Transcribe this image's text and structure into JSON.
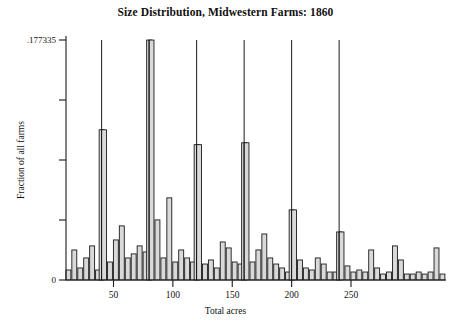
{
  "chart_data": {
    "type": "bar",
    "title": "Size Distribution, Midwestern Farms: 1860",
    "xlabel": "Total acres",
    "ylabel": "Fraction of all farms",
    "xlim": [
      10,
      330
    ],
    "ylim": [
      0,
      0.177335
    ],
    "grid": false,
    "legend": null,
    "bin_width": 5,
    "y_ticks": [
      {
        "value": 0.177335,
        "label": ".177335"
      },
      {
        "value": 0.13300125,
        "label": ""
      },
      {
        "value": 0.0886675,
        "label": ""
      },
      {
        "value": 0.04433375,
        "label": ""
      },
      {
        "value": 0,
        "label": "0"
      }
    ],
    "x_ticks": [
      {
        "value": 50,
        "label": "50"
      },
      {
        "value": 100,
        "label": "100"
      },
      {
        "value": 150,
        "label": "150"
      },
      {
        "value": 200,
        "label": "200"
      },
      {
        "value": 250,
        "label": "250"
      }
    ],
    "categories": [
      12,
      17,
      22,
      27,
      32,
      37,
      40,
      42,
      47,
      52,
      57,
      62,
      67,
      72,
      77,
      80,
      82,
      87,
      92,
      97,
      102,
      107,
      112,
      117,
      120,
      122,
      127,
      132,
      137,
      142,
      147,
      152,
      157,
      160,
      162,
      167,
      172,
      177,
      182,
      187,
      192,
      197,
      200,
      202,
      207,
      212,
      217,
      222,
      227,
      232,
      237,
      240,
      242,
      247,
      252,
      257,
      262,
      267,
      272,
      277,
      282,
      287,
      292,
      297,
      302,
      307,
      312,
      317,
      322,
      327
    ],
    "values": [
      0.0074,
      0.0222,
      0.0089,
      0.0163,
      0.0252,
      0.0074,
      0.111,
      0.111,
      0.0133,
      0.0296,
      0.04,
      0.0163,
      0.0193,
      0.0252,
      0.0207,
      0.1773,
      0.1773,
      0.0444,
      0.0163,
      0.0607,
      0.0133,
      0.0222,
      0.0163,
      0.0133,
      0.1,
      0.1,
      0.0118,
      0.0148,
      0.0089,
      0.0281,
      0.0237,
      0.0133,
      0.0118,
      0.1014,
      0.1014,
      0.0133,
      0.0222,
      0.034,
      0.0163,
      0.0118,
      0.0089,
      0.0059,
      0.0518,
      0.0518,
      0.0148,
      0.0089,
      0.0074,
      0.0163,
      0.0118,
      0.0059,
      0.0059,
      0.0355,
      0.0355,
      0.0104,
      0.0059,
      0.0074,
      0.0059,
      0.0222,
      0.0089,
      0.0044,
      0.0059,
      0.0252,
      0.0148,
      0.0044,
      0.0044,
      0.0059,
      0.0044,
      0.0059,
      0.0237,
      0.0044
    ],
    "spikes": [
      {
        "x": 40,
        "value": 0.177335
      },
      {
        "x": 80,
        "value": 0.177335
      },
      {
        "x": 120,
        "value": 0.177335
      },
      {
        "x": 160,
        "value": 0.177335
      },
      {
        "x": 200,
        "value": 0.177335
      },
      {
        "x": 240,
        "value": 0.177335
      }
    ],
    "colors": {
      "bar_fill": "#d9d9d9",
      "bar_stroke": "#1a1a1a",
      "axis": "#1a1a1a",
      "text": "#111111",
      "background": "#ffffff"
    }
  }
}
